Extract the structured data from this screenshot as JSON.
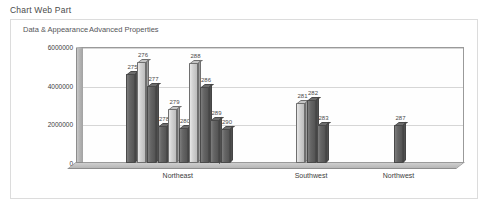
{
  "webpart": {
    "title": "Chart Web Part",
    "tabs": [
      {
        "label": "Data & Appearance",
        "selected": true
      },
      {
        "label": "Advanced Properties",
        "selected": false
      }
    ]
  },
  "chart_data": {
    "type": "bar",
    "title": "",
    "xlabel": "",
    "ylabel": "",
    "ylim": [
      0,
      6000000
    ],
    "yticks": [
      "0",
      "2000000",
      "4000000",
      "6000000"
    ],
    "ytick_values": [
      0,
      2000000,
      4000000,
      6000000
    ],
    "grid": true,
    "legend": "none",
    "style": "3d-column",
    "categories": [
      "Northeast",
      "Southwest",
      "Northwest"
    ],
    "groups": [
      {
        "category": "Northeast",
        "bars": [
          {
            "label": "275",
            "value": 4600000,
            "fill": "dark"
          },
          {
            "label": "276",
            "value": 5200000,
            "fill": "light"
          },
          {
            "label": "277",
            "value": 4000000,
            "fill": "dark"
          },
          {
            "label": "278",
            "value": 1900000,
            "fill": "dark"
          },
          {
            "label": "279",
            "value": 2800000,
            "fill": "light"
          },
          {
            "label": "280",
            "value": 1800000,
            "fill": "dark"
          },
          {
            "label": "288",
            "value": 5150000,
            "fill": "light"
          },
          {
            "label": "286",
            "value": 3950000,
            "fill": "dark"
          },
          {
            "label": "289",
            "value": 2250000,
            "fill": "dark"
          },
          {
            "label": "290",
            "value": 1750000,
            "fill": "dark"
          }
        ]
      },
      {
        "category": "Southwest",
        "bars": [
          {
            "label": "281",
            "value": 3100000,
            "fill": "light"
          },
          {
            "label": "282",
            "value": 3250000,
            "fill": "dark"
          },
          {
            "label": "283",
            "value": 1950000,
            "fill": "dark"
          }
        ]
      },
      {
        "category": "Northwest",
        "bars": [
          {
            "label": "287",
            "value": 1950000,
            "fill": "dark"
          }
        ]
      }
    ]
  },
  "colors": {
    "panel_border": "#dcdcdc",
    "plot_border": "#9a9a9a",
    "gridline": "#d6d6d6",
    "bar_light": "#d2d2d2",
    "bar_dark": "#5f5f5f",
    "text": "#4a4a4a"
  }
}
